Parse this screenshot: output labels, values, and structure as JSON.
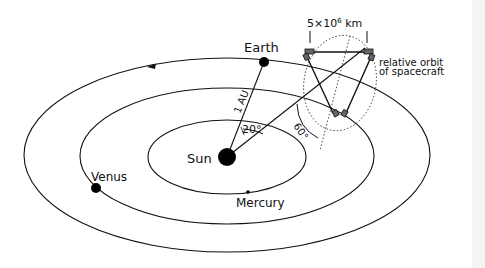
{
  "diagram": {
    "labels": {
      "earth": "Earth",
      "sun": "Sun",
      "venus": "Venus",
      "mercury": "Mercury",
      "distance": "1 AU",
      "angle_inclination": "20°",
      "angle_triangle": "60°",
      "arm_length_base": "5×10",
      "arm_length_exp": "6",
      "arm_length_unit": " km",
      "relative_orbit_line1": "relative orbit",
      "relative_orbit_line2": "of spacecraft"
    },
    "bodies": [
      {
        "name": "Sun",
        "x": 227,
        "y": 157,
        "r": 9
      },
      {
        "name": "Earth",
        "x": 264,
        "y": 62,
        "r": 5
      },
      {
        "name": "Venus",
        "x": 96,
        "y": 188,
        "r": 5
      },
      {
        "name": "Mercury",
        "x": 248,
        "y": 192,
        "r": 1.6
      }
    ],
    "orbits": [
      {
        "name": "Earth orbit",
        "cx": 227,
        "cy": 155,
        "rx": 203,
        "ry": 97
      },
      {
        "name": "Venus orbit",
        "cx": 227,
        "cy": 156,
        "rx": 147,
        "ry": 68
      },
      {
        "name": "Mercury orbit",
        "cx": 227,
        "cy": 157,
        "rx": 79,
        "ry": 37
      }
    ],
    "colors": {
      "ink": "#111111",
      "background": "#ffffff"
    }
  }
}
